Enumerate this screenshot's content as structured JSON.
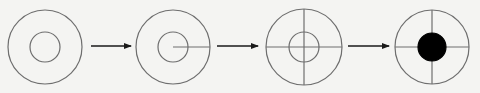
{
  "diagram": {
    "title": "",
    "background": "#f4f4f2",
    "stroke_color": "#6e6e6e",
    "arrow_color": "#1a1a1a",
    "fill_color": "#000000",
    "steps": [
      {
        "id": "step-1",
        "label": "",
        "cx": 45,
        "cy": 47,
        "outer_r": 37,
        "inner_r": 15,
        "radius_line": false,
        "crosshair": false,
        "filled_center": false
      },
      {
        "id": "step-2",
        "label": "",
        "cx": 173,
        "cy": 47,
        "outer_r": 37,
        "inner_r": 15,
        "radius_line": true,
        "crosshair": false,
        "filled_center": false
      },
      {
        "id": "step-3",
        "label": "",
        "cx": 304,
        "cy": 47,
        "outer_r": 38,
        "inner_r": 15,
        "radius_line": false,
        "crosshair": true,
        "filled_center": false
      },
      {
        "id": "step-4",
        "label": "",
        "cx": 432,
        "cy": 47,
        "outer_r": 37,
        "inner_r": 14,
        "radius_line": false,
        "crosshair": true,
        "filled_center": true
      }
    ],
    "arrows": [
      {
        "from": "step-1",
        "to": "step-2",
        "x1": 91,
        "x2": 131,
        "y": 46
      },
      {
        "from": "step-2",
        "to": "step-3",
        "x1": 217,
        "x2": 258,
        "y": 46
      },
      {
        "from": "step-3",
        "to": "step-4",
        "x1": 348,
        "x2": 389,
        "y": 46
      }
    ]
  }
}
